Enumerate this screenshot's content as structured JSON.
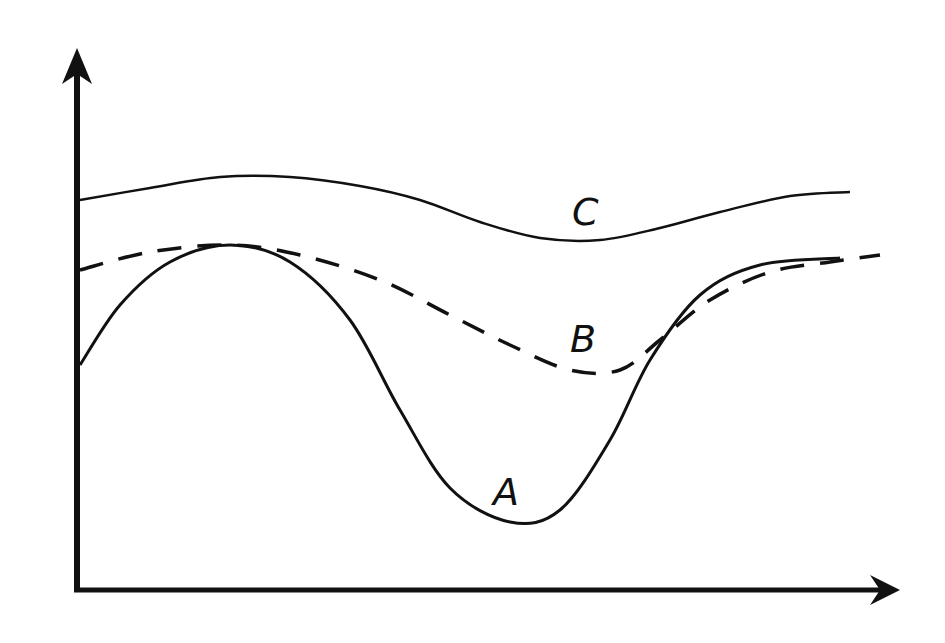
{
  "chart_data": {
    "type": "line",
    "title": "",
    "xlabel": "",
    "ylabel": "",
    "grid": false,
    "legend": "inline labels",
    "axes": {
      "origin": [
        77,
        590
      ],
      "x_end": [
        900,
        590
      ],
      "y_end": [
        77,
        50
      ]
    },
    "series": [
      {
        "name": "A",
        "style": "solid",
        "label_pos": [
          495,
          505
        ],
        "points": [
          [
            80,
            365
          ],
          [
            120,
            305
          ],
          [
            170,
            262
          ],
          [
            230,
            245
          ],
          [
            290,
            262
          ],
          [
            350,
            320
          ],
          [
            400,
            410
          ],
          [
            450,
            488
          ],
          [
            510,
            522
          ],
          [
            560,
            510
          ],
          [
            610,
            440
          ],
          [
            650,
            360
          ],
          [
            700,
            295
          ],
          [
            760,
            265
          ],
          [
            840,
            258
          ]
        ]
      },
      {
        "name": "B",
        "style": "dashed",
        "label_pos": [
          572,
          350
        ],
        "points": [
          [
            80,
            270
          ],
          [
            150,
            252
          ],
          [
            230,
            245
          ],
          [
            300,
            255
          ],
          [
            380,
            280
          ],
          [
            450,
            315
          ],
          [
            510,
            345
          ],
          [
            570,
            370
          ],
          [
            620,
            370
          ],
          [
            660,
            340
          ],
          [
            710,
            300
          ],
          [
            770,
            272
          ],
          [
            830,
            262
          ],
          [
            880,
            255
          ]
        ]
      },
      {
        "name": "C",
        "style": "solid-thin",
        "label_pos": [
          572,
          225
        ],
        "points": [
          [
            80,
            200
          ],
          [
            150,
            188
          ],
          [
            220,
            177
          ],
          [
            290,
            177
          ],
          [
            360,
            186
          ],
          [
            420,
            200
          ],
          [
            480,
            222
          ],
          [
            540,
            238
          ],
          [
            600,
            240
          ],
          [
            660,
            228
          ],
          [
            720,
            212
          ],
          [
            790,
            196
          ],
          [
            850,
            192
          ]
        ]
      }
    ]
  },
  "labels": {
    "a": "A",
    "b": "B",
    "c": "C"
  }
}
